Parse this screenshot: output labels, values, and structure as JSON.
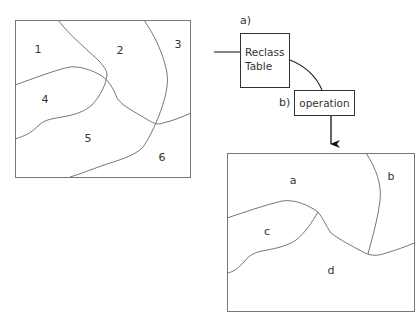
{
  "input_map": {
    "zones": [
      {
        "label": "1",
        "x": 38,
        "y": 53
      },
      {
        "label": "2",
        "x": 120,
        "y": 54
      },
      {
        "label": "3",
        "x": 178,
        "y": 48
      },
      {
        "label": "4",
        "x": 45,
        "y": 103
      },
      {
        "label": "5",
        "x": 88,
        "y": 142
      },
      {
        "label": "6",
        "x": 162,
        "y": 161
      }
    ]
  },
  "reclass": {
    "step_label": "a)",
    "box_line1": "Reclass",
    "box_line2": "Table"
  },
  "operation": {
    "step_label": "b)",
    "box_label": "operation"
  },
  "output_map": {
    "zones": [
      {
        "label": "a",
        "x": 293,
        "y": 184
      },
      {
        "label": "b",
        "x": 391,
        "y": 180
      },
      {
        "label": "c",
        "x": 267,
        "y": 235
      },
      {
        "label": "d",
        "x": 331,
        "y": 274
      }
    ]
  },
  "colors": {
    "line": "#555555",
    "text": "#333333",
    "background": "#ffffff"
  }
}
